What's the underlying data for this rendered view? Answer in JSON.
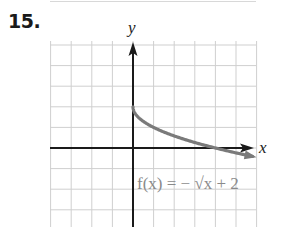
{
  "problem": {
    "number": "15."
  },
  "chart_data": {
    "type": "line",
    "title": "",
    "xlabel": "x",
    "ylabel": "y",
    "function_label": "f(x) = − √x + 2",
    "equation": "f(x) = -sqrt(x) + 2",
    "grid": true,
    "xlim": [
      -4,
      6
    ],
    "ylim": [
      -3.3,
      5
    ],
    "grid_spacing": 1,
    "tick_labels_shown": false,
    "series": [
      {
        "name": "f(x) = -√x + 2",
        "color": "#7a7a7a",
        "x": [
          0,
          0.25,
          0.5,
          1,
          2,
          3,
          4,
          5,
          5.8
        ],
        "y": [
          2,
          1.5,
          1.29,
          1,
          0.59,
          0.27,
          0,
          -0.24,
          -0.41
        ],
        "end_arrow": true
      }
    ],
    "key_points": [
      {
        "x": 0,
        "y": 2,
        "note": "starting point (y-intercept)"
      },
      {
        "x": 4,
        "y": 0,
        "note": "x-intercept"
      }
    ]
  },
  "colors": {
    "grid": "#cfcfcf",
    "axes": "#1a1a1a",
    "curve": "#7a7a7a"
  }
}
